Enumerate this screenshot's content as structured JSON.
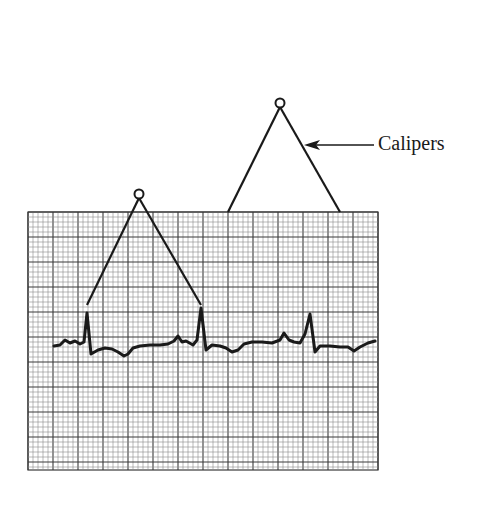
{
  "figure": {
    "label": "Calipers",
    "colors": {
      "ink": "#1a1a1a",
      "grid_minor": "#8a8a8a",
      "grid_major": "#3a3a3a",
      "background": "#ffffff"
    },
    "grid": {
      "x": 28,
      "y": 212,
      "width": 350,
      "height": 258,
      "minor_step": 5,
      "major_every": 5
    },
    "calipers": [
      {
        "name": "large-caliper",
        "pivot": [
          280,
          103
        ],
        "left_tip": [
          228,
          212
        ],
        "right_tip": [
          340,
          212
        ]
      },
      {
        "name": "small-caliper",
        "pivot": [
          139,
          194
        ],
        "left_tip": [
          87,
          305
        ],
        "right_tip": [
          201,
          305
        ]
      }
    ],
    "arrow": {
      "from": [
        374,
        145
      ],
      "to": [
        304,
        145
      ]
    },
    "label_pos": [
      378,
      132
    ],
    "ecg_trace": "M54,346 L60,345 L65,340 L70,343 L75,341 L80,344 L84,342 L87,313 L91,354 L98,350 L105,348 L112,349 L118,352 L124,356 L128,354 L133,348 L140,346 L150,345 L160,345 L168,344 L174,341 L178,336 L182,342 L186,341 L193,345 L197,340 L201,308 L206,350 L212,345 L220,346 L226,348 L232,352 L238,350 L244,344 L252,342 L262,342 L272,343 L280,340 L284,333 L289,340 L294,342 L300,343 L305,334 L310,314 L315,352 L320,346 L330,346 L340,347 L348,347 L354,351 L360,347 L368,343 L375,341"
  }
}
